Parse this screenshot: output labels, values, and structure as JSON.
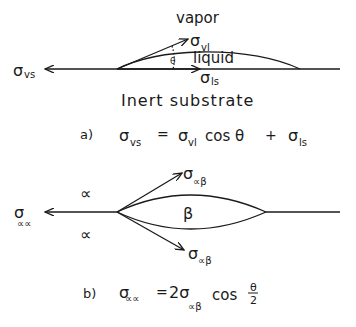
{
  "diagram_a": {
    "phase_top": "vapor",
    "phase_drop": "liquid",
    "phase_bottom": "Inert substrate",
    "angle_label": "θ",
    "tension_vs": {
      "symbol": "σ",
      "sub": "vs"
    },
    "tension_vl": {
      "symbol": "σ",
      "sub": "vl"
    },
    "tension_ls": {
      "symbol": "σ",
      "sub": "ls"
    },
    "equation": {
      "tag": "a)",
      "lhs_symbol": "σ",
      "lhs_sub": "vs",
      "eq": "=",
      "t1_symbol": "σ",
      "t1_sub": "vl",
      "t1_func": "cos θ",
      "plus": "+",
      "t2_symbol": "σ",
      "t2_sub": "ls"
    }
  },
  "diagram_b": {
    "phase_upper": "∝",
    "phase_lower": "∝",
    "phase_lens": "β",
    "tension_aa": {
      "symbol": "σ",
      "sub": "∝∝"
    },
    "tension_ab_upper": {
      "symbol": "σ",
      "sub": "∝β"
    },
    "tension_ab_lower": {
      "symbol": "σ",
      "sub": "∝β"
    },
    "equation": {
      "tag": "b)",
      "lhs_symbol": "σ",
      "lhs_sub": "∝∝",
      "eq": "=",
      "coef": "2σ",
      "rhs_sub": "∝β",
      "func": "cos",
      "frac_num": "θ",
      "frac_den": "2"
    }
  }
}
